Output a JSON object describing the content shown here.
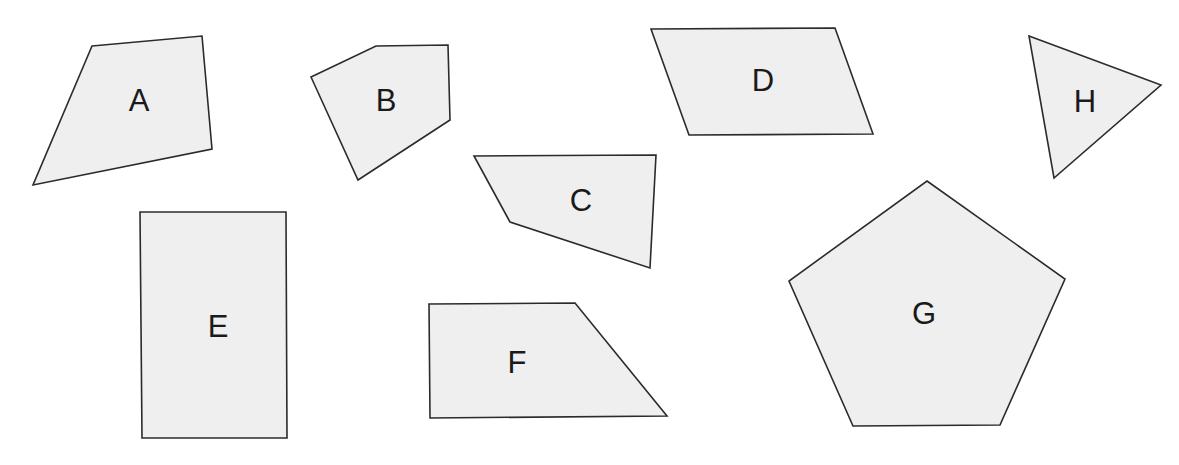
{
  "heading": {
    "text_partial": "g                                            y",
    "note": "Only descenders of a heading are visible at the top edge"
  },
  "style": {
    "fill_color": "#efefef",
    "stroke_color": "#2b2b2b",
    "label_color": "#1a1a1a",
    "background": "#ffffff"
  },
  "shapes": [
    {
      "id": "A",
      "label": "A",
      "type": "quadrilateral",
      "points": "92,46 202,36 212,149 33,185",
      "label_x": 139,
      "label_y": 111
    },
    {
      "id": "B",
      "label": "B",
      "type": "pentagon",
      "points": "311,77 376,46 448,45 450,120 358,180",
      "label_x": 386,
      "label_y": 111
    },
    {
      "id": "C",
      "label": "C",
      "type": "quadrilateral",
      "points": "474,156 656,155 650,268 510,222",
      "label_x": 581,
      "label_y": 211
    },
    {
      "id": "D",
      "label": "D",
      "type": "parallelogram",
      "points": "651,29 835,28 873,134 689,135",
      "label_x": 763,
      "label_y": 91
    },
    {
      "id": "E",
      "label": "E",
      "type": "rectangle",
      "points": "140,212 286,212 287,438 142,438",
      "label_x": 218,
      "label_y": 337
    },
    {
      "id": "F",
      "label": "F",
      "type": "trapezoid",
      "points": "429,304 575,303 667,416 430,418",
      "label_x": 517,
      "label_y": 373
    },
    {
      "id": "G",
      "label": "G",
      "type": "regular-pentagon",
      "points": "927,181 1065,279 1000,425 853,426 789,281",
      "label_x": 924,
      "label_y": 324
    },
    {
      "id": "H",
      "label": "H",
      "type": "triangle",
      "points": "1029,36 1161,85 1054,178",
      "label_x": 1085,
      "label_y": 112
    }
  ]
}
